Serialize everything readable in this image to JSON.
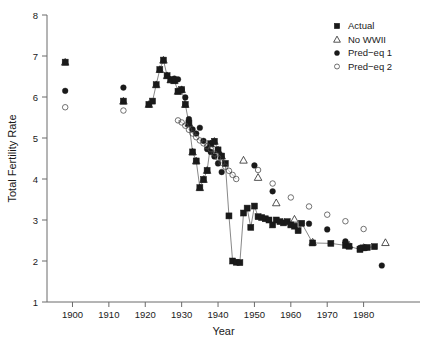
{
  "chart_data": {
    "type": "scatter",
    "title": "",
    "xlabel": "Year",
    "ylabel": "Total Fertility Rate",
    "xlim": [
      1893,
      1990
    ],
    "ylim": [
      1,
      8
    ],
    "xticks": [
      1900,
      1910,
      1920,
      1930,
      1940,
      1950,
      1960,
      1970,
      1980
    ],
    "yticks": [
      1,
      2,
      3,
      4,
      5,
      6,
      7,
      8
    ],
    "grid": false,
    "legend_position": "top-right",
    "series": [
      {
        "name": "Actual",
        "marker": "filled-square",
        "color": "#1a1a1a",
        "connected": true,
        "points": [
          [
            1898,
            6.85
          ],
          [
            1914,
            5.9
          ],
          [
            1921,
            5.82
          ],
          [
            1922,
            5.9
          ],
          [
            1923,
            6.3
          ],
          [
            1924,
            6.67
          ],
          [
            1925,
            6.9
          ],
          [
            1926,
            6.52
          ],
          [
            1927,
            6.42
          ],
          [
            1928,
            6.4
          ],
          [
            1929,
            6.14
          ],
          [
            1930,
            6.18
          ],
          [
            1931,
            5.82
          ],
          [
            1932,
            5.36
          ],
          [
            1933,
            4.66
          ],
          [
            1934,
            4.44
          ],
          [
            1935,
            3.79
          ],
          [
            1936,
            3.99
          ],
          [
            1937,
            4.21
          ],
          [
            1938,
            4.86
          ],
          [
            1939,
            4.92
          ],
          [
            1940,
            4.71
          ],
          [
            1941,
            4.56
          ],
          [
            1942,
            4.38
          ],
          [
            1943,
            3.1
          ],
          [
            1944,
            2.0
          ],
          [
            1945,
            1.97
          ],
          [
            1946,
            1.96
          ],
          [
            1947,
            3.17
          ],
          [
            1948,
            3.29
          ],
          [
            1949,
            2.82
          ],
          [
            1950,
            3.34
          ],
          [
            1951,
            3.08
          ],
          [
            1952,
            3.06
          ],
          [
            1953,
            3.03
          ],
          [
            1954,
            3.0
          ],
          [
            1955,
            2.88
          ],
          [
            1956,
            3.0
          ],
          [
            1957,
            2.96
          ],
          [
            1958,
            2.93
          ],
          [
            1959,
            2.96
          ],
          [
            1960,
            2.88
          ],
          [
            1961,
            2.85
          ],
          [
            1962,
            2.74
          ],
          [
            1963,
            2.92
          ],
          [
            1966,
            2.44
          ],
          [
            1971,
            2.43
          ],
          [
            1975,
            2.38
          ],
          [
            1976,
            2.36
          ],
          [
            1979,
            2.28
          ],
          [
            1980,
            2.32
          ],
          [
            1981,
            2.33
          ],
          [
            1983,
            2.35
          ]
        ]
      },
      {
        "name": "No WWII",
        "marker": "open-triangle",
        "color": "#1a1a1a",
        "connected": false,
        "points": [
          [
            1898,
            6.85
          ],
          [
            1914,
            5.9
          ],
          [
            1921,
            5.82
          ],
          [
            1923,
            6.3
          ],
          [
            1924,
            6.67
          ],
          [
            1925,
            6.9
          ],
          [
            1926,
            6.52
          ],
          [
            1927,
            6.42
          ],
          [
            1928,
            6.4
          ],
          [
            1929,
            6.14
          ],
          [
            1930,
            6.18
          ],
          [
            1931,
            5.82
          ],
          [
            1932,
            5.36
          ],
          [
            1933,
            4.66
          ],
          [
            1934,
            4.44
          ],
          [
            1935,
            3.79
          ],
          [
            1936,
            3.99
          ],
          [
            1937,
            4.21
          ],
          [
            1938,
            4.86
          ],
          [
            1939,
            4.92
          ],
          [
            1940,
            4.71
          ],
          [
            1941,
            4.56
          ],
          [
            1947,
            4.46
          ],
          [
            1951,
            4.04
          ],
          [
            1956,
            3.42
          ],
          [
            1961,
            3.02
          ],
          [
            1966,
            2.46
          ],
          [
            1976,
            2.39
          ],
          [
            1980,
            2.33
          ],
          [
            1986,
            2.45
          ]
        ]
      },
      {
        "name": "Pred-eq 1",
        "marker": "filled-circle",
        "color": "#1a1a1a",
        "connected": false,
        "points": [
          [
            1898,
            6.15
          ],
          [
            1914,
            6.23
          ],
          [
            1928,
            6.45
          ],
          [
            1929,
            6.43
          ],
          [
            1930,
            6.18
          ],
          [
            1931,
            5.99
          ],
          [
            1932,
            5.46
          ],
          [
            1933,
            5.21
          ],
          [
            1934,
            5.11
          ],
          [
            1935,
            5.25
          ],
          [
            1936,
            4.93
          ],
          [
            1937,
            4.73
          ],
          [
            1938,
            4.66
          ],
          [
            1939,
            4.55
          ],
          [
            1940,
            4.38
          ],
          [
            1941,
            4.17
          ],
          [
            1950,
            4.33
          ],
          [
            1955,
            3.7
          ],
          [
            1965,
            2.91
          ],
          [
            1970,
            2.77
          ],
          [
            1975,
            2.48
          ],
          [
            1979,
            2.32
          ],
          [
            1985,
            1.89
          ]
        ]
      },
      {
        "name": "Pred-eq 2",
        "marker": "open-circle",
        "color": "#1a1a1a",
        "connected": false,
        "points": [
          [
            1898,
            5.75
          ],
          [
            1914,
            5.67
          ],
          [
            1929,
            5.43
          ],
          [
            1930,
            5.38
          ],
          [
            1931,
            5.3
          ],
          [
            1932,
            5.2
          ],
          [
            1933,
            5.11
          ],
          [
            1934,
            5.02
          ],
          [
            1935,
            4.94
          ],
          [
            1936,
            4.87
          ],
          [
            1937,
            4.8
          ],
          [
            1938,
            4.73
          ],
          [
            1939,
            4.62
          ],
          [
            1940,
            4.52
          ],
          [
            1941,
            4.4
          ],
          [
            1942,
            4.3
          ],
          [
            1943,
            4.2
          ],
          [
            1944,
            4.1
          ],
          [
            1945,
            4.0
          ],
          [
            1951,
            4.22
          ],
          [
            1955,
            3.89
          ],
          [
            1960,
            3.55
          ],
          [
            1965,
            3.33
          ],
          [
            1970,
            3.13
          ],
          [
            1975,
            2.97
          ],
          [
            1980,
            2.78
          ]
        ]
      }
    ],
    "legend": [
      {
        "label": "Actual",
        "marker": "filled-square"
      },
      {
        "label": "No WWII",
        "marker": "open-triangle"
      },
      {
        "label": "Pred−eq 1",
        "marker": "filled-circle"
      },
      {
        "label": "Pred−eq 2",
        "marker": "open-circle"
      }
    ]
  }
}
